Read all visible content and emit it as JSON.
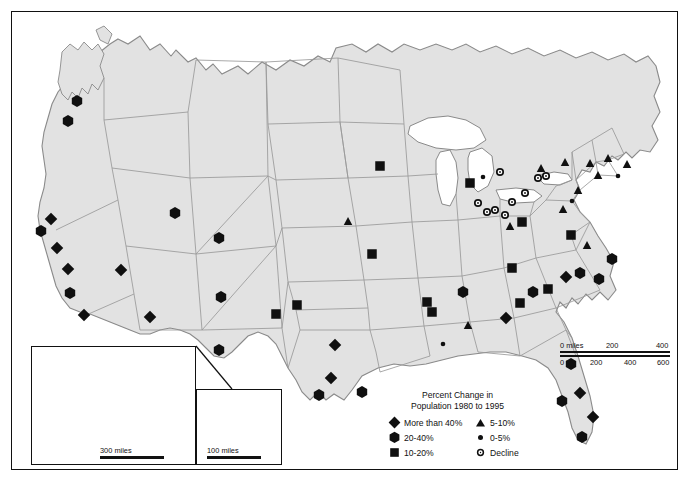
{
  "map": {
    "title_line1": "Percent Change in",
    "title_line2": "Population 1980 to 1995",
    "land_fill": "#e2e2e2",
    "land_stroke": "#8a8a8a",
    "border_color": "#111111",
    "symbol_color": "#101010",
    "background": "#ffffff"
  },
  "legend": {
    "items_left": [
      {
        "symbol": "diamond-icon",
        "label": "More than 40%"
      },
      {
        "symbol": "hexagon-icon",
        "label": "20-40%"
      },
      {
        "symbol": "square-icon",
        "label": "10-20%"
      }
    ],
    "items_right": [
      {
        "symbol": "triangle-icon",
        "label": "5-10%"
      },
      {
        "symbol": "dot-icon",
        "label": "0-5%"
      },
      {
        "symbol": "open-circle-icon",
        "label": "Decline"
      }
    ]
  },
  "scales": {
    "main": {
      "miles_ticks": [
        "0 miles",
        "200",
        "400"
      ],
      "km_ticks": [
        "0 km",
        "200",
        "400",
        "600"
      ]
    },
    "alaska": {
      "label": "300 miles"
    },
    "hawaii": {
      "label": "100 miles"
    }
  },
  "insets": [
    {
      "name": "alaska-inset",
      "scale_label": "300 miles"
    },
    {
      "name": "hawaii-inset",
      "scale_label": "100 miles"
    }
  ],
  "chart_data": {
    "type": "map",
    "title": "Percent Change in Population 1980 to 1995",
    "classes": [
      {
        "key": "more-than-40",
        "label": "More than 40%",
        "symbol": "diamond"
      },
      {
        "key": "20-40",
        "label": "20-40%",
        "symbol": "hexagon"
      },
      {
        "key": "10-20",
        "label": "10-20%",
        "symbol": "square"
      },
      {
        "key": "5-10",
        "label": "5-10%",
        "symbol": "triangle"
      },
      {
        "key": "0-5",
        "label": "0-5%",
        "symbol": "dot"
      },
      {
        "key": "decline",
        "label": "Decline",
        "symbol": "open-circle"
      }
    ],
    "points": [
      {
        "x": 77,
        "y": 101,
        "cls": "20-40"
      },
      {
        "x": 68,
        "y": 121,
        "cls": "20-40"
      },
      {
        "x": 51,
        "y": 219,
        "cls": "more-than-40"
      },
      {
        "x": 41,
        "y": 231,
        "cls": "20-40"
      },
      {
        "x": 57,
        "y": 248,
        "cls": "more-than-40"
      },
      {
        "x": 68,
        "y": 269,
        "cls": "more-than-40"
      },
      {
        "x": 70,
        "y": 293,
        "cls": "20-40"
      },
      {
        "x": 84,
        "y": 315,
        "cls": "more-than-40"
      },
      {
        "x": 121,
        "y": 270,
        "cls": "more-than-40"
      },
      {
        "x": 150,
        "y": 317,
        "cls": "more-than-40"
      },
      {
        "x": 175,
        "y": 213,
        "cls": "20-40"
      },
      {
        "x": 219,
        "y": 238,
        "cls": "20-40"
      },
      {
        "x": 221,
        "y": 297,
        "cls": "20-40"
      },
      {
        "x": 219,
        "y": 350,
        "cls": "20-40"
      },
      {
        "x": 276,
        "y": 314,
        "cls": "10-20"
      },
      {
        "x": 297,
        "y": 305,
        "cls": "10-20"
      },
      {
        "x": 335,
        "y": 345,
        "cls": "more-than-40"
      },
      {
        "x": 331,
        "y": 378,
        "cls": "more-than-40"
      },
      {
        "x": 319,
        "y": 395,
        "cls": "20-40"
      },
      {
        "x": 362,
        "y": 392,
        "cls": "20-40"
      },
      {
        "x": 372,
        "y": 254,
        "cls": "10-20"
      },
      {
        "x": 380,
        "y": 166,
        "cls": "10-20"
      },
      {
        "x": 348,
        "y": 221,
        "cls": "5-10"
      },
      {
        "x": 427,
        "y": 302,
        "cls": "10-20"
      },
      {
        "x": 432,
        "y": 312,
        "cls": "10-20"
      },
      {
        "x": 468,
        "y": 325,
        "cls": "5-10"
      },
      {
        "x": 443,
        "y": 344,
        "cls": "dot"
      },
      {
        "x": 470,
        "y": 183,
        "cls": "10-20"
      },
      {
        "x": 463,
        "y": 292,
        "cls": "20-40"
      },
      {
        "x": 483,
        "y": 177,
        "cls": "dot"
      },
      {
        "x": 500,
        "y": 172,
        "cls": "decline"
      },
      {
        "x": 478,
        "y": 203,
        "cls": "decline"
      },
      {
        "x": 487,
        "y": 212,
        "cls": "decline"
      },
      {
        "x": 495,
        "y": 210,
        "cls": "decline"
      },
      {
        "x": 505,
        "y": 215,
        "cls": "decline"
      },
      {
        "x": 512,
        "y": 202,
        "cls": "decline"
      },
      {
        "x": 525,
        "y": 193,
        "cls": "decline"
      },
      {
        "x": 538,
        "y": 178,
        "cls": "decline"
      },
      {
        "x": 546,
        "y": 176,
        "cls": "decline"
      },
      {
        "x": 522,
        "y": 222,
        "cls": "10-20"
      },
      {
        "x": 510,
        "y": 226,
        "cls": "5-10"
      },
      {
        "x": 541,
        "y": 168,
        "cls": "5-10"
      },
      {
        "x": 565,
        "y": 162,
        "cls": "5-10"
      },
      {
        "x": 590,
        "y": 163,
        "cls": "5-10"
      },
      {
        "x": 608,
        "y": 158,
        "cls": "5-10"
      },
      {
        "x": 627,
        "y": 164,
        "cls": "5-10"
      },
      {
        "x": 598,
        "y": 175,
        "cls": "5-10"
      },
      {
        "x": 618,
        "y": 176,
        "cls": "dot"
      },
      {
        "x": 578,
        "y": 190,
        "cls": "5-10"
      },
      {
        "x": 572,
        "y": 201,
        "cls": "dot"
      },
      {
        "x": 563,
        "y": 209,
        "cls": "5-10"
      },
      {
        "x": 571,
        "y": 235,
        "cls": "10-20"
      },
      {
        "x": 587,
        "y": 245,
        "cls": "5-10"
      },
      {
        "x": 612,
        "y": 259,
        "cls": "20-40"
      },
      {
        "x": 580,
        "y": 273,
        "cls": "20-40"
      },
      {
        "x": 599,
        "y": 279,
        "cls": "20-40"
      },
      {
        "x": 566,
        "y": 277,
        "cls": "more-than-40"
      },
      {
        "x": 533,
        "y": 292,
        "cls": "20-40"
      },
      {
        "x": 520,
        "y": 303,
        "cls": "10-20"
      },
      {
        "x": 548,
        "y": 289,
        "cls": "10-20"
      },
      {
        "x": 506,
        "y": 318,
        "cls": "more-than-40"
      },
      {
        "x": 512,
        "y": 268,
        "cls": "10-20"
      },
      {
        "x": 571,
        "y": 364,
        "cls": "20-40"
      },
      {
        "x": 580,
        "y": 393,
        "cls": "more-than-40"
      },
      {
        "x": 562,
        "y": 401,
        "cls": "20-40"
      },
      {
        "x": 593,
        "y": 417,
        "cls": "more-than-40"
      },
      {
        "x": 582,
        "y": 437,
        "cls": "20-40"
      },
      {
        "x": 236,
        "y": 416,
        "cls": "10-20"
      }
    ]
  }
}
